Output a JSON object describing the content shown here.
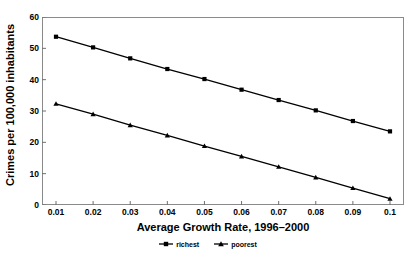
{
  "chart_data": {
    "type": "line",
    "title": "",
    "xlabel": "Average Growth Rate, 1996–2000",
    "ylabel": "Crimes per 100,000 inhabitants",
    "x": [
      0.01,
      0.02,
      0.03,
      0.04,
      0.05,
      0.06,
      0.07,
      0.08,
      0.09,
      0.1
    ],
    "xticklabels": [
      "0.01",
      "0.02",
      "0.03",
      "0.04",
      "0.05",
      "0.06",
      "0.07",
      "0.08",
      "0.09",
      "0.1"
    ],
    "yticklabels": [
      "0",
      "10",
      "20",
      "30",
      "40",
      "50",
      "60"
    ],
    "yticks": [
      0,
      10,
      20,
      30,
      40,
      50,
      60
    ],
    "xlim": [
      0.005,
      0.105
    ],
    "ylim": [
      0,
      60
    ],
    "grid": false,
    "legend_position": "bottom",
    "series": [
      {
        "name": "richest",
        "marker": "square",
        "color": "#000000",
        "values": [
          53.7,
          50.3,
          46.8,
          43.4,
          40.2,
          36.8,
          33.5,
          30.2,
          26.8,
          23.5
        ]
      },
      {
        "name": "poorest",
        "marker": "triangle",
        "color": "#000000",
        "values": [
          32.3,
          29.0,
          25.5,
          22.2,
          18.8,
          15.5,
          12.2,
          8.8,
          5.4,
          2.0
        ]
      }
    ]
  },
  "axes": {
    "y_title": "Crimes per 100,000 inhabitants",
    "x_title": "Average Growth Rate, 1996–2000"
  },
  "legend": {
    "items": [
      {
        "label": "richest"
      },
      {
        "label": "poorest"
      }
    ]
  }
}
